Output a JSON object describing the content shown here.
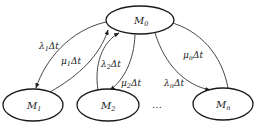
{
  "diagram": {
    "nodes": [
      {
        "id": "M0",
        "base": "M",
        "sub": "0",
        "cx": 140,
        "cy": 20,
        "rx": 34,
        "ry": 14
      },
      {
        "id": "M1",
        "base": "M",
        "sub": "1",
        "cx": 33,
        "cy": 105,
        "rx": 30,
        "ry": 16
      },
      {
        "id": "M2",
        "base": "M",
        "sub": "2",
        "cx": 108,
        "cy": 105,
        "rx": 31,
        "ry": 16
      },
      {
        "id": "Mn",
        "base": "M",
        "sub": "n",
        "cx": 223,
        "cy": 104,
        "rx": 30,
        "ry": 16
      }
    ],
    "ellipsis": "…",
    "edges": [
      {
        "from": "M0",
        "to": "M1",
        "label_base": "λ",
        "label_sub": "1",
        "label_rest": "Δt"
      },
      {
        "from": "M1",
        "to": "M0",
        "label_base": "μ",
        "label_sub": "1",
        "label_rest": "Δt"
      },
      {
        "from": "M2",
        "to": "M0",
        "label_base": "λ",
        "label_sub": "2",
        "label_rest": "Δt"
      },
      {
        "from": "M0",
        "to": "M2",
        "label_base": "μ",
        "label_sub": "2",
        "label_rest": "Δt"
      },
      {
        "from": "M0",
        "to": "Mn",
        "label_base": "λ",
        "label_sub": "n",
        "label_rest": "Δt"
      },
      {
        "from": "Mn",
        "to": "M0",
        "label_base": "μ",
        "label_sub": "n",
        "label_rest": "Δt"
      }
    ]
  }
}
